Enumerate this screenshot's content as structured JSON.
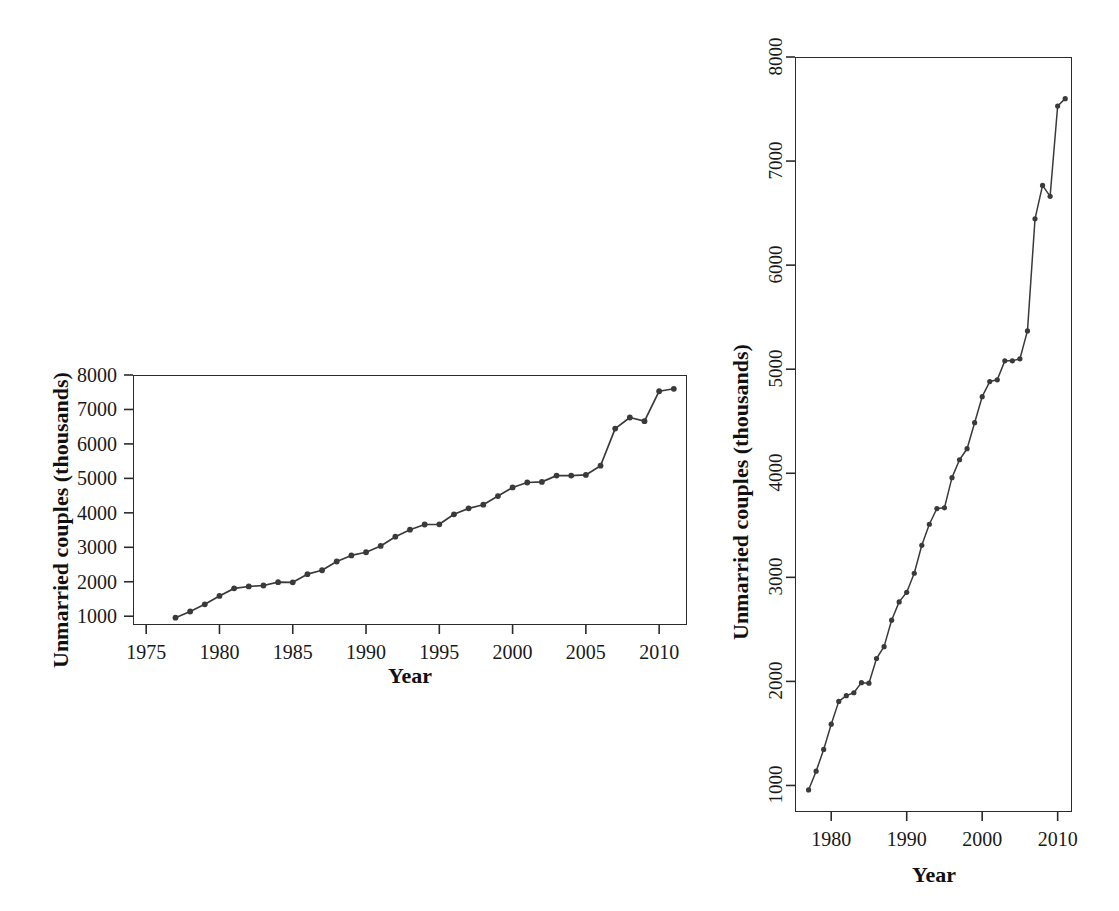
{
  "figure": {
    "background_color": "#ffffff",
    "line_color": "#3a3a3a",
    "point_color": "#3a3a3a",
    "axis_color": "#2b2b2b"
  },
  "panels": [
    {
      "id": "left",
      "name": "wide-aspect-panel",
      "xlabel": "Year",
      "ylabel": "Unmarried couples (thousands)",
      "x_ticks": [
        "1975",
        "1980",
        "1985",
        "1990",
        "1995",
        "2000",
        "2005",
        "2010"
      ],
      "y_ticks": [
        "1000",
        "2000",
        "3000",
        "4000",
        "5000",
        "6000",
        "7000",
        "8000"
      ],
      "y_tick_orientation": "horizontal"
    },
    {
      "id": "right",
      "name": "tall-aspect-panel",
      "xlabel": "Year",
      "ylabel": "Unmarried couples (thousands)",
      "x_ticks": [
        "1980",
        "1990",
        "2000",
        "2010"
      ],
      "y_ticks": [
        "1000",
        "2000",
        "3000",
        "4000",
        "5000",
        "6000",
        "7000",
        "8000"
      ],
      "y_tick_orientation": "rotated-90"
    }
  ],
  "chart_data": {
    "type": "line",
    "title": "",
    "subtitle": "",
    "xlabel": "Year",
    "ylabel": "Unmarried couples (thousands)",
    "xlim": [
      1975.5,
      2011.5
    ],
    "ylim": [
      700,
      8000
    ],
    "grid": false,
    "legend": "none",
    "markers": "filled-circle",
    "panel_note": "Same series drawn twice at different aspect ratios (banking to 45 degrees)",
    "x": [
      1977,
      1978,
      1979,
      1980,
      1981,
      1982,
      1983,
      1984,
      1985,
      1986,
      1987,
      1988,
      1989,
      1990,
      1991,
      1992,
      1993,
      1994,
      1995,
      1996,
      1997,
      1998,
      1999,
      2000,
      2001,
      2002,
      2003,
      2004,
      2005,
      2006,
      2007,
      2008,
      2009,
      2010,
      2011
    ],
    "series": [
      {
        "name": "Unmarried couples (thousands)",
        "values": [
          957,
          1137,
          1346,
          1589,
          1808,
          1863,
          1891,
          1988,
          1983,
          2220,
          2334,
          2588,
          2764,
          2856,
          3039,
          3308,
          3510,
          3661,
          3668,
          3958,
          4130,
          4236,
          4486,
          4736,
          4881,
          4898,
          5080,
          5080,
          5100,
          5368,
          6445,
          6766,
          6661,
          7529,
          7600
        ]
      }
    ],
    "x_tick_values_left": [
      1975,
      1980,
      1985,
      1990,
      1995,
      2000,
      2005,
      2010
    ],
    "x_tick_values_right": [
      1980,
      1990,
      2000,
      2010
    ],
    "y_tick_values": [
      1000,
      2000,
      3000,
      4000,
      5000,
      6000,
      7000,
      8000
    ]
  }
}
